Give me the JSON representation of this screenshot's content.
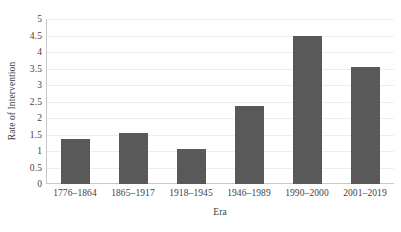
{
  "chart_data": {
    "type": "bar",
    "title": "",
    "subtitle": "",
    "xlabel": "Era",
    "ylabel": "Rate of Intervention",
    "categories": [
      "1776–1864",
      "1865–1917",
      "1918–1945",
      "1946–1989",
      "1990–2000",
      "2001–2019"
    ],
    "values": [
      1.35,
      1.55,
      1.05,
      2.35,
      4.5,
      3.55
    ],
    "ylim": [
      0,
      5
    ],
    "ytick_step": 0.5,
    "ytick_labels": [
      "5",
      "4.5",
      "4",
      "3.5",
      "3",
      "2.5",
      "2",
      "1.5",
      "1",
      "0.5",
      "0"
    ],
    "ytick_values": [
      5,
      4.5,
      4,
      3.5,
      3,
      2.5,
      2,
      1.5,
      1,
      0.5,
      0
    ],
    "grid": "horizontal",
    "legend": "none",
    "bar_color": "#595959",
    "gridline_color": "#ededed",
    "axis_color": "#c8c8c8",
    "text_color": "#3f3f3f",
    "background": "#ffffff"
  }
}
